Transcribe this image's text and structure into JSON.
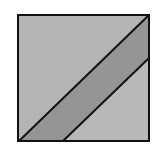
{
  "diagram": {
    "title": "",
    "square": {
      "x": 18,
      "y": 15,
      "width": 131,
      "height": 126,
      "stroke": "#111111"
    },
    "regions": [
      {
        "name": "upper-left-triangle",
        "fill": "#b4b4b4",
        "points": "18,15 149,15 18,141"
      },
      {
        "name": "middle-band",
        "fill": "#959595",
        "points": "19,141 149,15 149,58 63,141"
      },
      {
        "name": "lower-right-triangle",
        "fill": "#b8b8b8",
        "points": "63,141 149,58 149,141"
      }
    ],
    "lines": [
      {
        "name": "diagonal-line-1",
        "x1": 19,
        "y1": 141,
        "x2": 149,
        "y2": 15
      },
      {
        "name": "diagonal-line-2",
        "x1": 63,
        "y1": 141,
        "x2": 149,
        "y2": 58
      }
    ],
    "colors": {
      "background": "#ffffff",
      "stroke": "#111111",
      "light_fill": "#b4b4b4",
      "dark_fill": "#959595"
    }
  }
}
